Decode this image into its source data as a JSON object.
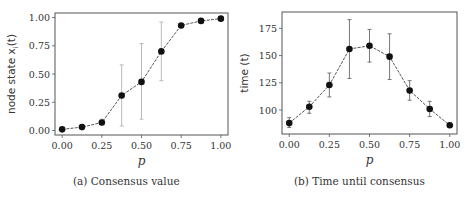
{
  "chart_data": [
    {
      "type": "line",
      "title": "",
      "caption": "(a) Consensus value",
      "xlabel": "p",
      "ylabel": "node state x_i(t)",
      "ylabel_display": "node state x",
      "ylabel_sub": "i",
      "ylabel_tail": "(t)",
      "x": [
        0.0,
        0.125,
        0.25,
        0.375,
        0.5,
        0.625,
        0.75,
        0.875,
        1.0
      ],
      "series": [
        {
          "name": "consensus value",
          "values": [
            0.01,
            0.03,
            0.07,
            0.31,
            0.43,
            0.7,
            0.93,
            0.97,
            0.99
          ],
          "err_low": [
            0.0,
            0.02,
            0.05,
            0.04,
            0.1,
            0.44,
            0.92,
            0.96,
            0.98
          ],
          "err_high": [
            0.02,
            0.04,
            0.1,
            0.58,
            0.77,
            0.96,
            0.94,
            0.98,
            1.0
          ]
        }
      ],
      "xticks": [
        "0.00",
        "0.25",
        "0.50",
        "0.75",
        "1.00"
      ],
      "xtick_values": [
        0.0,
        0.25,
        0.5,
        0.75,
        1.0
      ],
      "yticks": [
        "0.00",
        "0.25",
        "0.50",
        "0.75",
        "1.00"
      ],
      "ytick_values": [
        0.0,
        0.25,
        0.5,
        0.75,
        1.0
      ],
      "xlim": [
        -0.045,
        1.045
      ],
      "ylim": [
        -0.04,
        1.04
      ],
      "grid": false,
      "legend": "none",
      "colors": {
        "line": "#444444",
        "marker": "#111111",
        "errorbar": "#aaaaaa",
        "frame": "#555555"
      }
    },
    {
      "type": "line",
      "title": "",
      "caption": "(b) Time until consensus",
      "xlabel": "p",
      "ylabel": "time (t)",
      "ylabel_display": "time (t)",
      "x": [
        0.0,
        0.125,
        0.25,
        0.375,
        0.5,
        0.625,
        0.75,
        0.875,
        1.0
      ],
      "series": [
        {
          "name": "time until consensus",
          "values": [
            88,
            103,
            123,
            156,
            159,
            149,
            118,
            101,
            86
          ],
          "err_low": [
            84,
            97,
            112,
            129,
            144,
            128,
            109,
            94,
            84
          ],
          "err_high": [
            93,
            108,
            134,
            183,
            174,
            170,
            127,
            108,
            88
          ]
        }
      ],
      "xticks": [
        "0.00",
        "0.25",
        "0.50",
        "0.75",
        "1.00"
      ],
      "xtick_values": [
        0.0,
        0.25,
        0.5,
        0.75,
        1.0
      ],
      "yticks": [
        "100",
        "125",
        "150",
        "175"
      ],
      "ytick_values": [
        100,
        125,
        150,
        175
      ],
      "xlim": [
        -0.045,
        1.045
      ],
      "ylim": [
        78,
        190
      ],
      "grid": false,
      "legend": "none",
      "colors": {
        "line": "#444444",
        "marker": "#111111",
        "errorbar": "#555555",
        "frame": "#555555"
      }
    }
  ]
}
